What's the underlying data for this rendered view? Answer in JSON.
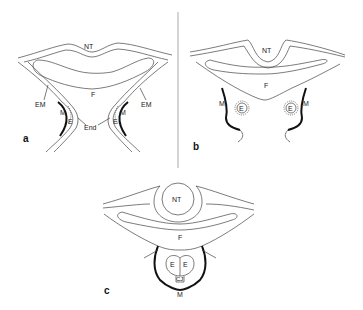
{
  "figure": {
    "panels": [
      {
        "id": "a",
        "panel_label": "a",
        "labels": {
          "neural_tube": "NT",
          "foregut": "F",
          "extraembryonic_mesoderm_left": "EM",
          "extraembryonic_mesoderm_right": "EM",
          "mesoderm_left": "M",
          "mesoderm_right": "M",
          "endocardium_left": "E",
          "endocardium_right": "E",
          "endoderm": "End"
        }
      },
      {
        "id": "b",
        "panel_label": "b",
        "labels": {
          "neural_tube": "NT",
          "foregut": "F",
          "mesoderm_left": "M",
          "mesoderm_right": "M",
          "endocardial_tube_left": "E",
          "endocardial_tube_right": "E"
        }
      },
      {
        "id": "c",
        "panel_label": "c",
        "labels": {
          "neural_tube": "NT",
          "foregut": "F",
          "endocardial_tube_left": "E",
          "endocardial_tube_right": "E",
          "cardiac_jelly": "CJ",
          "myocardium": "M"
        }
      }
    ]
  },
  "colors": {
    "line": "#444444",
    "thick_line": "#111111",
    "background": "#ffffff"
  }
}
